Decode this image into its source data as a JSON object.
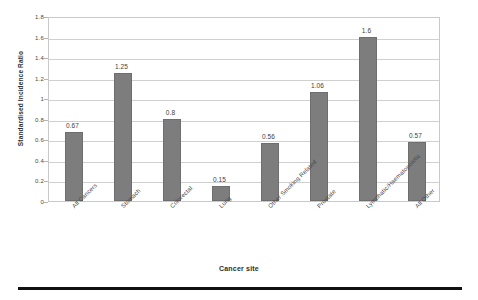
{
  "chart_data": {
    "type": "bar",
    "title": "",
    "xlabel": "Cancer site",
    "ylabel": "Standardised Incidence Ratio",
    "ylim": [
      0,
      1.8
    ],
    "ytick_labels": [
      "1.8",
      "1.6",
      "1.4",
      "1.2",
      "1",
      "0.8",
      "0.6",
      "0.4",
      "0.2",
      "0"
    ],
    "ytick_values": [
      1.8,
      1.6,
      1.4,
      1.2,
      1.0,
      0.8,
      0.6,
      0.4,
      0.2,
      0
    ],
    "grid": true,
    "legend": "none",
    "bar_color": "#7d7d7d",
    "categories": [
      "All Cancers",
      "Stomach",
      "Colorectal",
      "Lung",
      "Other Smoking Related",
      "Prostate",
      "Lymphatic/Haematopoietic",
      "All Other"
    ],
    "values": [
      0.67,
      1.25,
      0.8,
      0.15,
      0.56,
      1.06,
      1.6,
      0.57
    ],
    "value_labels": [
      "0.67",
      "1.25",
      "0.8",
      "0.15",
      "0.56",
      "1.06",
      "1.6",
      "0.57"
    ]
  },
  "figure": {
    "bottom_rule": true
  }
}
